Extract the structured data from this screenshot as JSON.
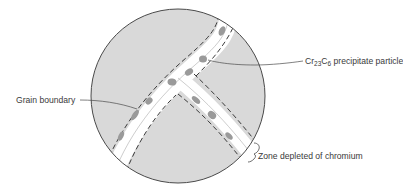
{
  "figure": {
    "type": "schematic cross-section of grain boundaries",
    "colors": {
      "grain_fill": "#d9d9d9",
      "depleted_zone_fill": "#ffffff",
      "precipitate_fill": "#9a9a9a",
      "outline": "#4a4a4a",
      "dashed_boundary": "#3c3c3c",
      "text": "#3a3a3a"
    }
  },
  "labels": {
    "grain_boundary": "Grain boundary",
    "precipitate": {
      "prefix": "Cr",
      "sub1": "23",
      "mid": "C",
      "sub2": "6",
      "suffix": " precipitate particle"
    },
    "depleted_zone": "Zone depleted of chromium"
  }
}
